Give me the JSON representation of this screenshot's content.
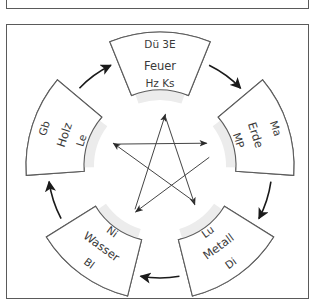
{
  "colors": {
    "frame": "#5a5a5a",
    "sector_stroke": "#5c5c5c",
    "sector_shade": "#ececec",
    "arrow": "#1a1a1a",
    "star_line": "#444444",
    "text": "#3a3a3a"
  },
  "elements": [
    {
      "name": "Feuer",
      "outer_label": "Dü 3E",
      "inner_label": "Hz Ks",
      "angle": 0
    },
    {
      "name": "Erde",
      "outer_label": "Ma",
      "inner_label": "MP",
      "angle": 72
    },
    {
      "name": "Metall",
      "outer_label": "Di",
      "inner_label": "Lu",
      "angle": 144
    },
    {
      "name": "Wasser",
      "outer_label": "Bl",
      "inner_label": "Ni",
      "angle": 216
    },
    {
      "name": "Holz",
      "outer_label": "Gb",
      "inner_label": "Le",
      "angle": 288
    }
  ],
  "generation_cycle": [
    {
      "from": "Feuer",
      "to": "Erde"
    },
    {
      "from": "Erde",
      "to": "Metall"
    },
    {
      "from": "Metall",
      "to": "Wasser"
    },
    {
      "from": "Wasser",
      "to": "Holz"
    },
    {
      "from": "Holz",
      "to": "Feuer"
    }
  ],
  "control_cycle": [
    {
      "from": "Holz",
      "to": "Erde"
    },
    {
      "from": "Erde",
      "to": "Wasser"
    },
    {
      "from": "Wasser",
      "to": "Feuer"
    },
    {
      "from": "Feuer",
      "to": "Metall"
    },
    {
      "from": "Metall",
      "to": "Holz"
    }
  ]
}
